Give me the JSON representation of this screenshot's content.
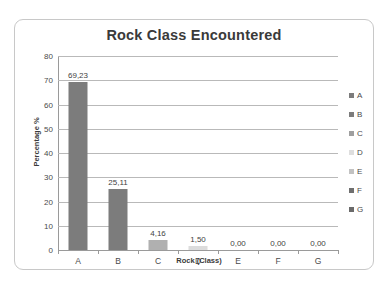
{
  "chart_data": {
    "type": "bar",
    "title": "Rock Class Encountered",
    "xlabel": "Rock (Class)",
    "ylabel": "Percentage %",
    "categories": [
      "A",
      "B",
      "C",
      "D",
      "E",
      "F",
      "G"
    ],
    "values": [
      69.23,
      25.11,
      4.16,
      1.5,
      0.0,
      0.0,
      0.0
    ],
    "value_labels": [
      "69,23",
      "25,11",
      "4,16",
      "1,50",
      "0,00",
      "0,00",
      "0,00"
    ],
    "ylim": [
      0,
      80
    ],
    "y_ticks": [
      0,
      10,
      20,
      30,
      40,
      50,
      60,
      70,
      80
    ],
    "y_tick_labels": [
      "0",
      "10",
      "20",
      "30",
      "40",
      "50",
      "60",
      "70",
      "80"
    ],
    "grid": true,
    "legend_position": "right",
    "legend": [
      {
        "label": "A",
        "color": "#7c7c7c"
      },
      {
        "label": "B",
        "color": "#7c7c7c"
      },
      {
        "label": "C",
        "color": "#9f9f9f"
      },
      {
        "label": "D",
        "color": "#dedede"
      },
      {
        "label": "E",
        "color": "#c2c2c2"
      },
      {
        "label": "F",
        "color": "#6f6f6f"
      },
      {
        "label": "G",
        "color": "#6a6a6a"
      }
    ],
    "bar_colors": [
      "#7c7c7c",
      "#7c7c7c",
      "#b0b0b0",
      "#dcdcdc",
      "#c8c8c8",
      "#6f6f6f",
      "#6a6a6a"
    ],
    "colors": {
      "frame_border": "#c8c8c8",
      "gridline": "#b9b9b9",
      "axis": "#9a9a9a",
      "text": "#3f3f3f",
      "background": "#ffffff"
    }
  }
}
